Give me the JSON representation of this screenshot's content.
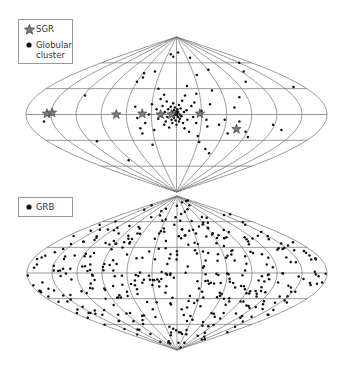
{
  "chart_data": [
    {
      "type": "scatter",
      "projection": "sinusoidal (galactic coordinates, all-sky)",
      "title": "",
      "grid": {
        "lon_step_deg": 30,
        "lat_step_deg": 30
      },
      "layout": {
        "cx": 176.5,
        "cy": 114.5,
        "half_width": 150.5,
        "half_height": 77.5
      },
      "legend": [
        {
          "label": "SGR",
          "marker": "star",
          "color": "#7a7a7a"
        },
        {
          "label": "Globular cluster",
          "marker": "dot",
          "color": "#111111"
        }
      ],
      "series": [
        {
          "name": "SGR",
          "marker": "star",
          "points_lonlat": [
            [
              -155,
              1
            ],
            [
              -149,
              2
            ],
            [
              -72,
              0
            ],
            [
              -41,
              1
            ],
            [
              -19,
              0
            ],
            [
              -6,
              0
            ],
            [
              28,
              1
            ],
            [
              75,
              -17
            ]
          ]
        },
        {
          "name": "Globular cluster",
          "marker": "dot",
          "points_lonlat": [
            [
              -160,
              -8
            ],
            [
              -118,
              22
            ],
            [
              -111,
              -31
            ],
            [
              -95,
              -53
            ],
            [
              -60,
              38
            ],
            [
              -58,
              48
            ],
            [
              -55,
              43
            ],
            [
              -50,
              9
            ],
            [
              -47,
              -4
            ],
            [
              -45,
              -16
            ],
            [
              -44,
              -22
            ],
            [
              -40,
              50
            ],
            [
              -38,
              -10
            ],
            [
              -35,
              -35
            ],
            [
              -33,
              0
            ],
            [
              -30,
              12
            ],
            [
              -28,
              -18
            ],
            [
              -25,
              30
            ],
            [
              -24,
              6
            ],
            [
              -22,
              -5
            ],
            [
              -20,
              18
            ],
            [
              -18,
              -2
            ],
            [
              -17,
              10
            ],
            [
              -16,
              23
            ],
            [
              -15,
              -12
            ],
            [
              -14,
              3
            ],
            [
              -13,
              -8
            ],
            [
              -12,
              15
            ],
            [
              -11,
              -3
            ],
            [
              -10,
              6
            ],
            [
              -9,
              -15
            ],
            [
              -8,
              1
            ],
            [
              -7,
              9
            ],
            [
              -6,
              -6
            ],
            [
              -5,
              3
            ],
            [
              -5,
              -10
            ],
            [
              -4,
              13
            ],
            [
              -4,
              -2
            ],
            [
              -3,
              5
            ],
            [
              -3,
              -4
            ],
            [
              -2,
              0
            ],
            [
              -2,
              8
            ],
            [
              -1,
              -7
            ],
            [
              -1,
              2
            ],
            [
              0,
              -1
            ],
            [
              0,
              4
            ],
            [
              0,
              -12
            ],
            [
              1,
              1
            ],
            [
              1,
              6
            ],
            [
              2,
              -3
            ],
            [
              2,
              3
            ],
            [
              3,
              -8
            ],
            [
              3,
              11
            ],
            [
              4,
              0
            ],
            [
              4,
              -5
            ],
            [
              5,
              7
            ],
            [
              6,
              -2
            ],
            [
              7,
              16
            ],
            [
              8,
              -10
            ],
            [
              9,
              3
            ],
            [
              10,
              -16
            ],
            [
              11,
              22
            ],
            [
              12,
              5
            ],
            [
              13,
              -6
            ],
            [
              15,
              33
            ],
            [
              16,
              -20
            ],
            [
              18,
              10
            ],
            [
              20,
              -3
            ],
            [
              22,
              14
            ],
            [
              24,
              -10
            ],
            [
              26,
              24
            ],
            [
              28,
              -25
            ],
            [
              30,
              4
            ],
            [
              32,
              -32
            ],
            [
              35,
              46
            ],
            [
              36,
              -6
            ],
            [
              38,
              -14
            ],
            [
              41,
              12
            ],
            [
              45,
              -40
            ],
            [
              48,
              28
            ],
            [
              52,
              -12
            ],
            [
              55,
              -45
            ],
            [
              58,
              -6
            ],
            [
              62,
              52
            ],
            [
              66,
              -22
            ],
            [
              70,
              8
            ],
            [
              76,
              -8
            ],
            [
              80,
              20
            ],
            [
              88,
              -20
            ],
            [
              95,
              -26
            ],
            [
              105,
              38
            ],
            [
              118,
              -12
            ],
            [
              125,
              50
            ],
            [
              132,
              -18
            ],
            [
              150,
              60
            ],
            [
              165,
              32
            ],
            [
              -10,
              67
            ],
            [
              -20,
              70
            ],
            [
              6,
              72
            ],
            [
              40,
              66
            ]
          ]
        }
      ]
    },
    {
      "type": "scatter",
      "projection": "sinusoidal (galactic coordinates, all-sky)",
      "title": "",
      "grid": {
        "lon_step_deg": 30,
        "lat_step_deg": 30
      },
      "layout": {
        "cx": 177,
        "cy": 273,
        "half_width": 150,
        "half_height": 77
      },
      "legend": [
        {
          "label": "GRB",
          "marker": "dot",
          "color": "#111111"
        }
      ],
      "series": [
        {
          "name": "GRB",
          "marker": "dot",
          "distribution": "isotropic",
          "count_approx": 420,
          "points_lonlat": "generated_isotropic"
        }
      ]
    }
  ],
  "legend_top": {
    "items": [
      {
        "label": "SGR"
      },
      {
        "label_line1": "Globular",
        "label_line2": "cluster"
      }
    ]
  },
  "legend_bottom": {
    "items": [
      {
        "label": "GRB"
      }
    ]
  },
  "colors": {
    "grid": "#6e6e6e",
    "star_fill": "#7a7a7a",
    "star_stroke": "#3a3a3a",
    "dot": "#111111",
    "legend_border": "#9a9a9a"
  }
}
